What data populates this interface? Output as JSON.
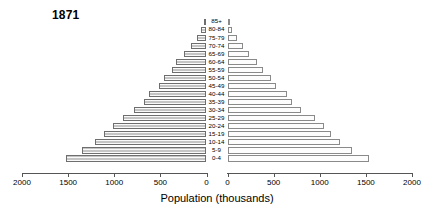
{
  "chart_data": {
    "type": "bar",
    "title": "1871",
    "xlabel": "Population (thousands)",
    "ylabel": "",
    "orientation": "horizontal-population-pyramid",
    "categories": [
      "0-4",
      "5-9",
      "10-14",
      "15-19",
      "20-24",
      "25-29",
      "30-34",
      "35-39",
      "40-44",
      "45-49",
      "50-54",
      "55-59",
      "60-64",
      "65-69",
      "70-74",
      "75-79",
      "80-84",
      "85+"
    ],
    "xticks_left": [
      2000,
      1500,
      1000,
      500,
      0
    ],
    "xticks_right": [
      0,
      500,
      1000,
      1500,
      2000
    ],
    "xlim": [
      0,
      2000
    ],
    "grid": false,
    "legend": "none",
    "series": [
      {
        "name": "Male",
        "side": "left",
        "values": [
          1520,
          1350,
          1210,
          1110,
          1010,
          900,
          790,
          680,
          620,
          520,
          460,
          370,
          330,
          240,
          170,
          105,
          55,
          22
        ]
      },
      {
        "name": "Female",
        "side": "right",
        "values": [
          1530,
          1355,
          1215,
          1120,
          1045,
          945,
          800,
          695,
          640,
          530,
          470,
          380,
          320,
          230,
          165,
          100,
          52,
          20
        ]
      }
    ]
  },
  "chart": {
    "title": "1871",
    "axis_title": "Population (thousands)",
    "left_tick_labels": [
      "2000",
      "1500",
      "1000",
      "500",
      "0"
    ],
    "right_tick_labels": [
      "0",
      "500",
      "1000",
      "1500",
      "2000"
    ],
    "age_labels": [
      "85+",
      "80-84",
      "75-79",
      "70-74",
      "65-69",
      "60-64",
      "55-59",
      "50-54",
      "45-49",
      "40-44",
      "35-39",
      "30-34",
      "25-29",
      "20-24",
      "15-19",
      "10-14",
      "5-9",
      "0-4"
    ],
    "colors": {
      "male_fill": "#d9d9d9",
      "female_fill": "#fdfdfd",
      "axis": "#555555",
      "text": "#000000"
    }
  }
}
